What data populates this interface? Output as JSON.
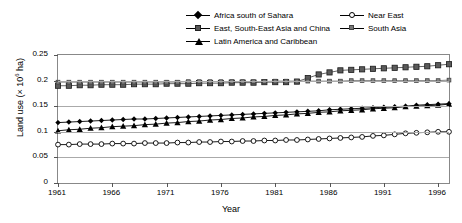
{
  "chart_data": {
    "type": "line",
    "title": "",
    "xlabel": "Year",
    "ylabel": "Land use (× 10⁶ ha)",
    "xlim": [
      1961,
      1997
    ],
    "ylim": [
      0,
      0.25
    ],
    "grid": true,
    "legend_position": "top",
    "xticks": [
      "1961",
      "1966",
      "1971",
      "1976",
      "1981",
      "1986",
      "1991",
      "1996"
    ],
    "xtick_values": [
      1961,
      1966,
      1971,
      1976,
      1981,
      1986,
      1991,
      1996
    ],
    "yticks": [
      "0",
      "0.05",
      "0.1",
      "0.15",
      "0.2",
      "0.25"
    ],
    "ytick_values": [
      0,
      0.05,
      0.1,
      0.15,
      0.2,
      0.25
    ],
    "x": [
      1961,
      1962,
      1963,
      1964,
      1965,
      1966,
      1967,
      1968,
      1969,
      1970,
      1971,
      1972,
      1973,
      1974,
      1975,
      1976,
      1977,
      1978,
      1979,
      1980,
      1981,
      1982,
      1983,
      1984,
      1985,
      1986,
      1987,
      1988,
      1989,
      1990,
      1991,
      1992,
      1993,
      1994,
      1995,
      1996,
      1997
    ],
    "series": [
      {
        "name": "Africa south of Sahara",
        "marker": "diamond",
        "color": "#000000",
        "values": [
          0.118,
          0.119,
          0.12,
          0.121,
          0.122,
          0.123,
          0.124,
          0.125,
          0.125,
          0.126,
          0.127,
          0.128,
          0.129,
          0.13,
          0.131,
          0.132,
          0.133,
          0.134,
          0.135,
          0.136,
          0.137,
          0.138,
          0.139,
          0.14,
          0.141,
          0.143,
          0.144,
          0.145,
          0.146,
          0.147,
          0.148,
          0.149,
          0.15,
          0.152,
          0.153,
          0.154,
          0.155
        ]
      },
      {
        "name": "East, South-East Asia and China",
        "marker": "square",
        "color": "#555555",
        "values": [
          0.19,
          0.19,
          0.191,
          0.191,
          0.192,
          0.192,
          0.192,
          0.193,
          0.193,
          0.193,
          0.194,
          0.194,
          0.194,
          0.195,
          0.195,
          0.195,
          0.196,
          0.196,
          0.196,
          0.197,
          0.197,
          0.197,
          0.198,
          0.205,
          0.212,
          0.216,
          0.22,
          0.221,
          0.222,
          0.223,
          0.224,
          0.225,
          0.226,
          0.227,
          0.228,
          0.23,
          0.232
        ]
      },
      {
        "name": "Latin America and Caribbean",
        "marker": "triangle",
        "color": "#000000",
        "values": [
          0.102,
          0.104,
          0.105,
          0.107,
          0.108,
          0.11,
          0.111,
          0.112,
          0.114,
          0.115,
          0.117,
          0.118,
          0.12,
          0.121,
          0.123,
          0.124,
          0.126,
          0.127,
          0.129,
          0.13,
          0.132,
          0.133,
          0.135,
          0.136,
          0.138,
          0.139,
          0.141,
          0.142,
          0.143,
          0.145,
          0.146,
          0.147,
          0.149,
          0.15,
          0.151,
          0.152,
          0.154
        ]
      },
      {
        "name": "Near East",
        "marker": "circle",
        "color": "#000000",
        "values": [
          0.075,
          0.075,
          0.076,
          0.076,
          0.076,
          0.077,
          0.077,
          0.077,
          0.078,
          0.078,
          0.078,
          0.079,
          0.079,
          0.08,
          0.08,
          0.081,
          0.081,
          0.082,
          0.082,
          0.083,
          0.083,
          0.084,
          0.084,
          0.085,
          0.086,
          0.087,
          0.088,
          0.089,
          0.09,
          0.092,
          0.093,
          0.095,
          0.097,
          0.098,
          0.099,
          0.1,
          0.1
        ]
      },
      {
        "name": "South Asia",
        "marker": "star",
        "color": "#777777",
        "values": [
          0.197,
          0.197,
          0.197,
          0.197,
          0.197,
          0.197,
          0.197,
          0.197,
          0.197,
          0.197,
          0.197,
          0.197,
          0.198,
          0.198,
          0.198,
          0.198,
          0.198,
          0.198,
          0.198,
          0.198,
          0.199,
          0.199,
          0.199,
          0.199,
          0.199,
          0.199,
          0.199,
          0.2,
          0.2,
          0.2,
          0.2,
          0.2,
          0.2,
          0.2,
          0.2,
          0.2,
          0.201
        ]
      }
    ]
  },
  "legend": {
    "left_items": [
      {
        "label": "Africa south of Sahara",
        "marker": "diamond"
      },
      {
        "label": "East, South-East Asia and China",
        "marker": "square"
      },
      {
        "label": "Latin America and Caribbean",
        "marker": "triangle"
      }
    ],
    "right_items": [
      {
        "label": "Near East",
        "marker": "circle"
      },
      {
        "label": "South Asia",
        "marker": "star"
      }
    ]
  },
  "axes": {
    "ylabel_main": "Land use (× 10",
    "ylabel_exp": "6",
    "ylabel_tail": " ha)",
    "xlabel": "Year"
  }
}
